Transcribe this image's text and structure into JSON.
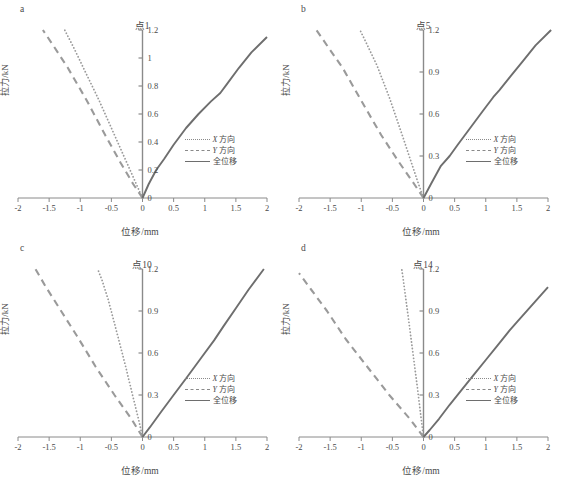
{
  "figure": {
    "axis_color": "#8a8a8a",
    "line_color_xy": "#9a9a9a",
    "line_color_total": "#6e6e6e",
    "text_color": "#4a4a4a"
  },
  "common": {
    "xlabel": "位移/mm",
    "ylabel": "拉力/kN",
    "xticks": [
      "-2",
      "-1.5",
      "-1",
      "-0.5",
      "0",
      "0.5",
      "1",
      "1.5",
      "2"
    ],
    "xtick_values": [
      -2,
      -1.5,
      -1,
      -0.5,
      0,
      0.5,
      1,
      1.5,
      2
    ],
    "xlim": [
      -2,
      2
    ],
    "legend": [
      {
        "label": "X 方向",
        "style": "dotted",
        "italic_prefix": "X",
        "rest": " 方向"
      },
      {
        "label": "Y 方向",
        "style": "dashed",
        "italic_prefix": "Y",
        "rest": " 方向"
      },
      {
        "label": "全位移",
        "style": "solid",
        "italic_prefix": "",
        "rest": "全位移"
      }
    ]
  },
  "panels": [
    {
      "letter": "a",
      "title": "点1",
      "yticks": [
        "0",
        "0.2",
        "0.4",
        "0.6",
        "0.8",
        "1",
        "1.2"
      ],
      "ytick_values": [
        0,
        0.2,
        0.4,
        0.6,
        0.8,
        1,
        1.2
      ],
      "ylim": [
        0,
        1.2
      ]
    },
    {
      "letter": "b",
      "title": "点5",
      "yticks": [
        "0",
        "0.3",
        "0.6",
        "0.9",
        "1.2"
      ],
      "ytick_values": [
        0,
        0.3,
        0.6,
        0.9,
        1.2
      ],
      "ylim": [
        0,
        1.2
      ]
    },
    {
      "letter": "c",
      "title": "点10",
      "yticks": [
        "0",
        "0.3",
        "0.6",
        "0.9",
        "1.2"
      ],
      "ytick_values": [
        0,
        0.3,
        0.6,
        0.9,
        1.2
      ],
      "ylim": [
        0,
        1.2
      ]
    },
    {
      "letter": "d",
      "title": "点14",
      "yticks": [
        "0",
        "0.3",
        "0.6",
        "0.9",
        "1.2"
      ],
      "ytick_values": [
        0,
        0.3,
        0.6,
        0.9,
        1.2
      ],
      "ylim": [
        0,
        1.2
      ]
    }
  ],
  "chart_data": [
    {
      "type": "line",
      "title": "点1",
      "panel": "a",
      "xlabel": "位移/mm",
      "ylabel": "拉力/kN",
      "xlim": [
        -2,
        2
      ],
      "ylim": [
        0,
        1.2
      ],
      "grid": false,
      "legend_position": "inside-right-lower",
      "series": [
        {
          "name": "X 方向",
          "style": "dotted",
          "x": [
            0,
            -0.1,
            -0.25,
            -0.45,
            -0.7,
            -0.95,
            -1.1,
            -1.25
          ],
          "y": [
            0,
            0.1,
            0.25,
            0.45,
            0.7,
            0.93,
            1.07,
            1.2
          ]
        },
        {
          "name": "Y 方向",
          "style": "dashed",
          "x": [
            0,
            -0.15,
            -0.35,
            -0.6,
            -0.9,
            -1.2,
            -1.42,
            -1.6
          ],
          "y": [
            0,
            0.1,
            0.25,
            0.45,
            0.7,
            0.93,
            1.08,
            1.2
          ]
        },
        {
          "name": "全位移",
          "style": "solid",
          "x": [
            0,
            0.1,
            0.22,
            0.35,
            0.5,
            0.7,
            0.9,
            1.1,
            1.25,
            1.35,
            1.55,
            1.75,
            2.0
          ],
          "y": [
            0,
            0.1,
            0.2,
            0.28,
            0.38,
            0.5,
            0.6,
            0.69,
            0.75,
            0.81,
            0.93,
            1.04,
            1.15
          ]
        }
      ]
    },
    {
      "type": "line",
      "title": "点5",
      "panel": "b",
      "xlabel": "位移/mm",
      "ylabel": "拉力/kN",
      "xlim": [
        -2,
        2
      ],
      "ylim": [
        0,
        1.2
      ],
      "grid": false,
      "legend_position": "inside-right-lower",
      "series": [
        {
          "name": "X 方向",
          "style": "dotted",
          "x": [
            0,
            -0.08,
            -0.2,
            -0.35,
            -0.55,
            -0.75,
            -0.9,
            -1.02
          ],
          "y": [
            0,
            0.1,
            0.26,
            0.46,
            0.72,
            0.95,
            1.09,
            1.2
          ]
        },
        {
          "name": "Y 方向",
          "style": "dashed",
          "x": [
            0,
            -0.15,
            -0.4,
            -0.68,
            -0.98,
            -1.3,
            -1.52,
            -1.72
          ],
          "y": [
            0,
            0.1,
            0.26,
            0.45,
            0.68,
            0.93,
            1.07,
            1.2
          ]
        },
        {
          "name": "全位移",
          "style": "solid",
          "x": [
            0,
            0.12,
            0.28,
            0.42,
            0.55,
            0.75,
            0.95,
            1.12,
            1.22,
            1.4,
            1.6,
            1.8,
            2.05
          ],
          "y": [
            0,
            0.1,
            0.23,
            0.3,
            0.38,
            0.5,
            0.62,
            0.72,
            0.77,
            0.87,
            0.98,
            1.09,
            1.2
          ]
        }
      ]
    },
    {
      "type": "line",
      "title": "点10",
      "panel": "c",
      "xlabel": "位移/mm",
      "ylabel": "拉力/kN",
      "xlim": [
        -2,
        2
      ],
      "ylim": [
        0,
        1.2
      ],
      "grid": false,
      "legend_position": "inside-right-lower",
      "series": [
        {
          "name": "X 方向",
          "style": "dotted",
          "x": [
            0,
            -0.06,
            -0.16,
            -0.28,
            -0.42,
            -0.55,
            -0.65,
            -0.72
          ],
          "y": [
            0,
            0.12,
            0.3,
            0.52,
            0.76,
            0.98,
            1.12,
            1.2
          ]
        },
        {
          "name": "Y 方向",
          "style": "dashed",
          "x": [
            0,
            -0.18,
            -0.45,
            -0.75,
            -1.05,
            -1.35,
            -1.55,
            -1.72
          ],
          "y": [
            0,
            0.13,
            0.3,
            0.5,
            0.72,
            0.93,
            1.07,
            1.2
          ]
        },
        {
          "name": "全位移",
          "style": "solid",
          "x": [
            0,
            0.12,
            0.3,
            0.5,
            0.72,
            0.95,
            1.15,
            1.3,
            1.5,
            1.7,
            1.95
          ],
          "y": [
            0,
            0.07,
            0.18,
            0.3,
            0.43,
            0.57,
            0.69,
            0.79,
            0.92,
            1.05,
            1.2
          ]
        }
      ]
    },
    {
      "type": "line",
      "title": "点14",
      "panel": "d",
      "xlabel": "位移/mm",
      "ylabel": "拉力/kN",
      "xlim": [
        -2,
        2
      ],
      "ylim": [
        0,
        1.2
      ],
      "grid": false,
      "legend_position": "inside-right-lower",
      "series": [
        {
          "name": "X 方向",
          "style": "dotted",
          "x": [
            0,
            -0.04,
            -0.1,
            -0.17,
            -0.24,
            -0.3,
            -0.33,
            -0.35
          ],
          "y": [
            0,
            0.14,
            0.36,
            0.6,
            0.84,
            1.04,
            1.14,
            1.2
          ]
        },
        {
          "name": "Y 方向",
          "style": "dashed",
          "x": [
            0,
            -0.22,
            -0.55,
            -0.9,
            -1.25,
            -1.55,
            -1.8,
            -2.0
          ],
          "y": [
            0,
            0.13,
            0.3,
            0.5,
            0.7,
            0.9,
            1.05,
            1.17
          ]
        },
        {
          "name": "全位移",
          "style": "solid",
          "x": [
            0,
            0.1,
            0.25,
            0.42,
            0.6,
            0.8,
            1.0,
            1.2,
            1.38,
            1.5,
            1.7,
            1.9,
            2.0
          ],
          "y": [
            0,
            0.05,
            0.13,
            0.23,
            0.33,
            0.44,
            0.55,
            0.66,
            0.76,
            0.82,
            0.92,
            1.02,
            1.07
          ]
        }
      ]
    }
  ]
}
